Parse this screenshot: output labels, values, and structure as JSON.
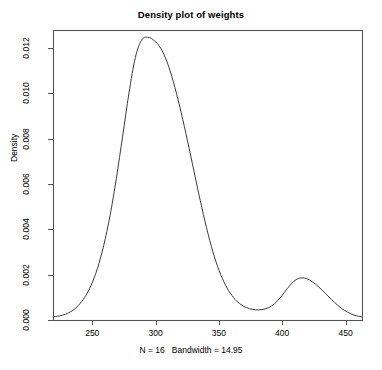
{
  "chart_data": {
    "type": "line",
    "title": "Density plot of weights",
    "subtitle": "",
    "xlabel": "N = 16   Bandwidth = 14.95",
    "ylabel": "Density",
    "grid": false,
    "legend": "none",
    "xlim": [
      219,
      463
    ],
    "ylim": [
      0.0,
      0.0128
    ],
    "x_ticks": [
      250,
      300,
      350,
      400,
      450
    ],
    "x_tick_labels": [
      "250",
      "300",
      "350",
      "400",
      "450"
    ],
    "y_ticks": [
      0.0,
      0.002,
      0.004,
      0.006,
      0.008,
      0.01,
      0.012
    ],
    "y_tick_labels": [
      "0.000",
      "0.002",
      "0.004",
      "0.006",
      "0.008",
      "0.010",
      "0.012"
    ],
    "annotations": {
      "n": "N = 16",
      "bandwidth": "Bandwidth = 14.95",
      "primary_peak_x": 300,
      "primary_peak_y": 0.01235,
      "secondary_peak_x": 415,
      "secondary_peak_y": 0.00185,
      "trough_x": 383,
      "trough_y": 0.00045
    },
    "series": [
      {
        "name": "density",
        "color": "#3c3c3c",
        "x": [
          219,
          224,
          229,
          234,
          239,
          244,
          249,
          254,
          259,
          264,
          269,
          274,
          279,
          284,
          289,
          294,
          299,
          304,
          309,
          314,
          319,
          324,
          329,
          334,
          339,
          344,
          349,
          354,
          359,
          364,
          369,
          374,
          379,
          384,
          389,
          394,
          399,
          404,
          409,
          414,
          419,
          424,
          429,
          434,
          439,
          444,
          449,
          454,
          459,
          463
        ],
        "y": [
          0.00014,
          0.00018,
          0.00026,
          0.0004,
          0.00064,
          0.001,
          0.00152,
          0.00226,
          0.00328,
          0.0046,
          0.00624,
          0.00812,
          0.01002,
          0.01158,
          0.01236,
          0.01248,
          0.01233,
          0.012,
          0.0114,
          0.01052,
          0.00944,
          0.00822,
          0.00692,
          0.0056,
          0.00436,
          0.00326,
          0.00236,
          0.00168,
          0.00118,
          0.00084,
          0.00062,
          0.0005,
          0.00045,
          0.00046,
          0.00054,
          0.00072,
          0.00102,
          0.00138,
          0.0017,
          0.00185,
          0.00183,
          0.00168,
          0.00145,
          0.00118,
          0.0009,
          0.00064,
          0.00043,
          0.00028,
          0.00018,
          0.00014
        ]
      }
    ]
  },
  "geometry": {
    "plot_left": 53,
    "plot_right": 362,
    "plot_top": 30,
    "plot_bottom": 320
  }
}
